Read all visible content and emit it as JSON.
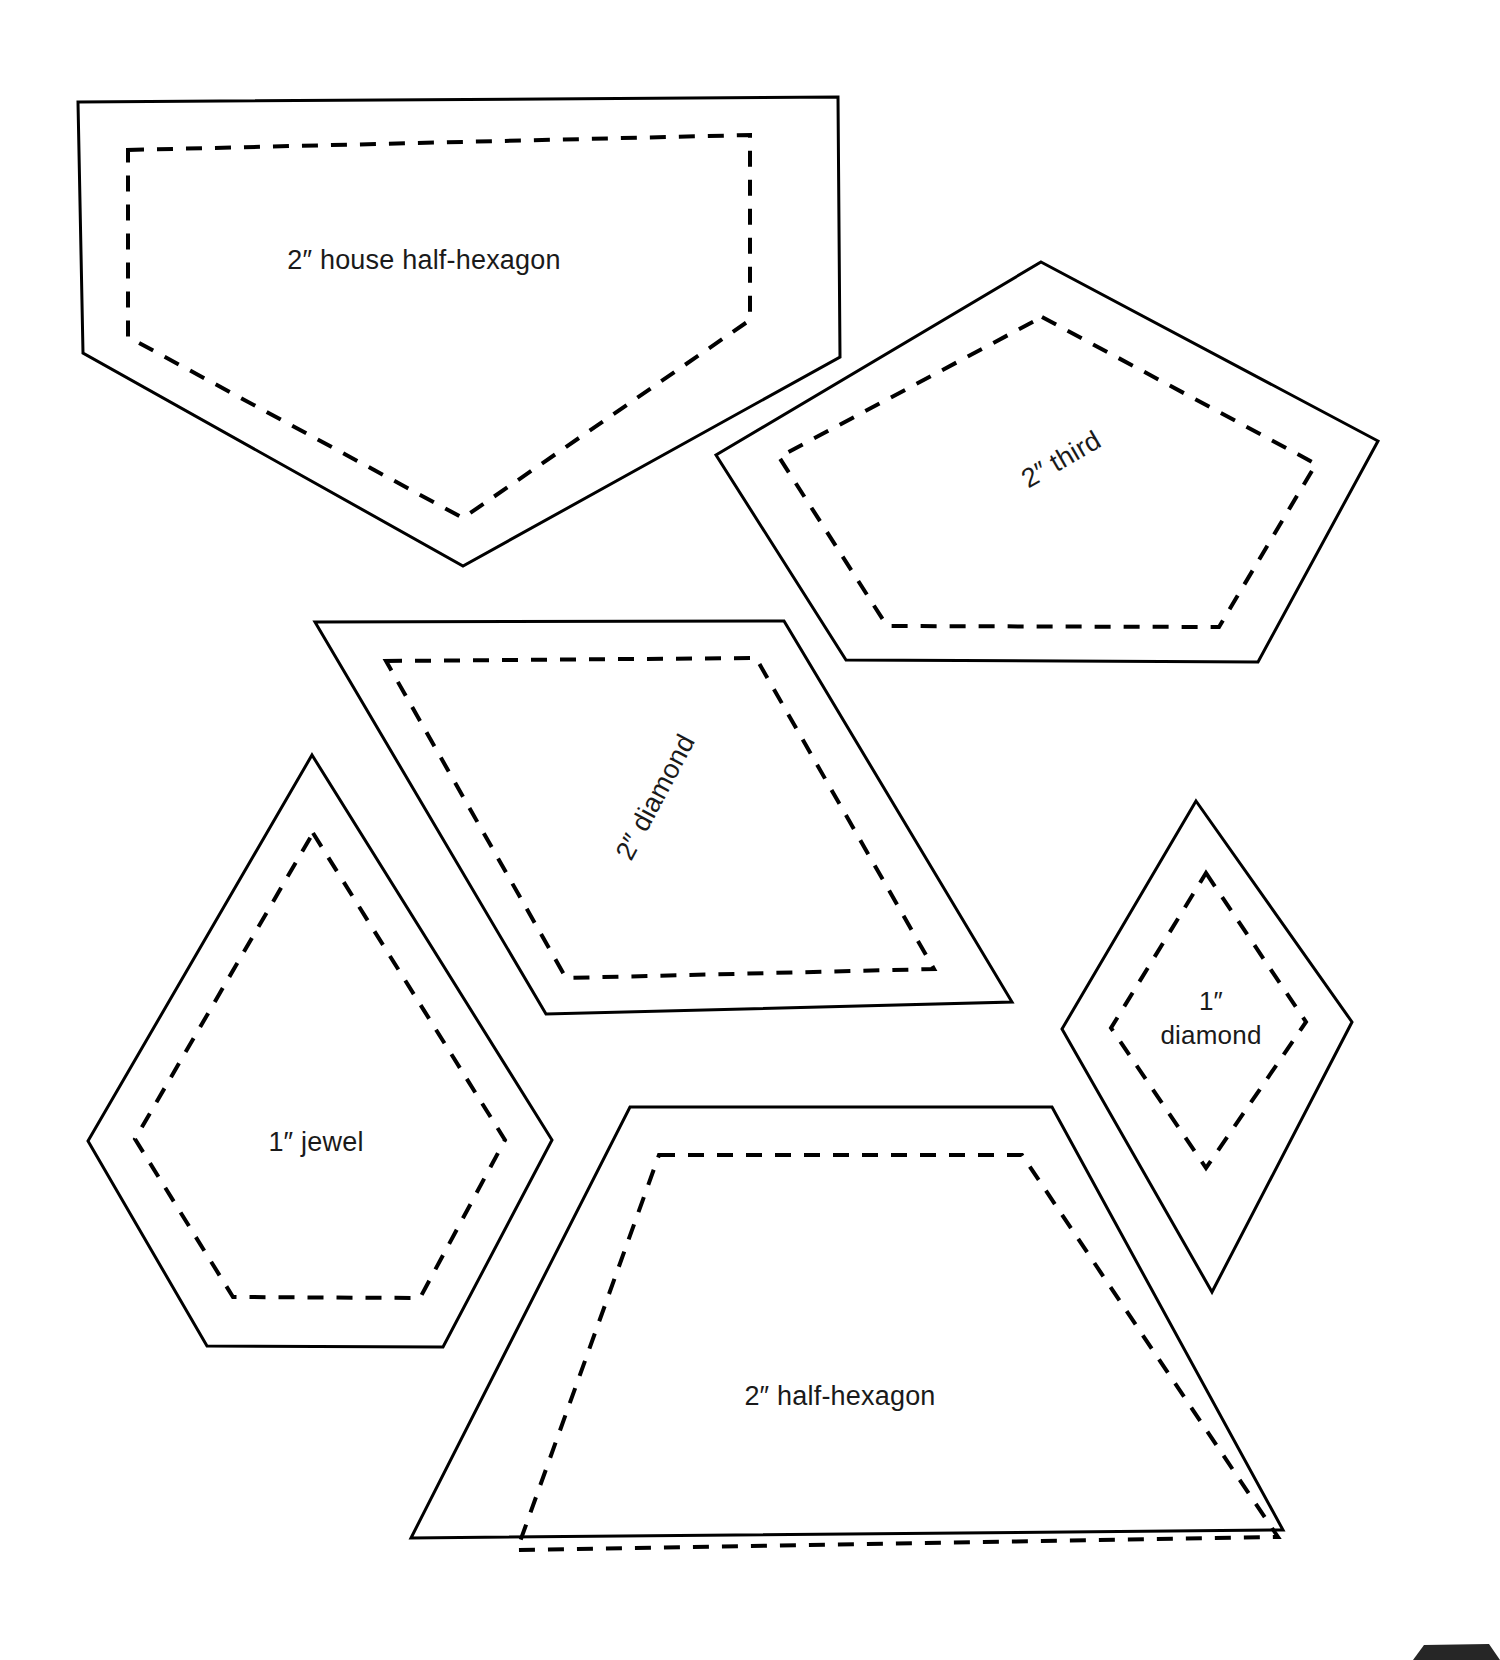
{
  "page": {
    "background_color": "#ffffff",
    "line_color": "#000000",
    "text_color": "#1a1a1a",
    "width": 1500,
    "height": 1660
  },
  "shapes": [
    {
      "id": "house-half-hexagon",
      "label": "2″ house half-hexagon",
      "label_x": 424,
      "label_y": 262,
      "label_rotation": 0,
      "cut_points": "78,102 838,97 840,357 463,566 83,353",
      "sew_points": "128,150 750,135 750,320 463,518 128,337"
    },
    {
      "id": "third",
      "label": "2″ third",
      "label_x": 1062,
      "label_y": 461,
      "label_rotation": -30,
      "cut_points": "1041,262 1378,441 1258,662 846,660 716,455",
      "sew_points": "1042,317 1316,464 1219,627 887,626 779,457"
    },
    {
      "id": "diamond-2in",
      "label": "2″ diamond",
      "label_x": 657,
      "label_y": 798,
      "label_rotation": -62,
      "cut_points": "315,622 784,621 1012,1002 546,1014",
      "sew_points": "386,661 756,658 934,969 566,978"
    },
    {
      "id": "jewel-1in",
      "label": "1″ jewel",
      "label_x": 316,
      "label_y": 1144,
      "label_rotation": 0,
      "cut_points": "312,755 552,1140 443,1347 207,1346 88,1141",
      "sew_points": "313,833 505,1140 420,1298 233,1297 135,1139"
    },
    {
      "id": "diamond-1in",
      "label_line1": "1″",
      "label_line2": "diamond",
      "label_x": 1211,
      "label_y": 1003,
      "label2_y": 1037,
      "label_rotation": 0,
      "cut_points": "1196,801 1352,1022 1212,1292 1062,1029",
      "sew_points": "1206,873 1306,1022 1206,1168 1111,1028"
    },
    {
      "id": "half-hexagon-2in",
      "label": "2″ half-hexagon",
      "label_x": 840,
      "label_y": 1398,
      "label_rotation": 0,
      "cut_points": "630,1107 1052,1107 1283,1530 411,1538",
      "sew_points": "659,1155 1022,1155 1278,1537 517,1550"
    }
  ],
  "corner_mark": {
    "id": "page-corner-mark",
    "points": "1424,1645 1489,1644 1500,1660 1413,1660"
  }
}
